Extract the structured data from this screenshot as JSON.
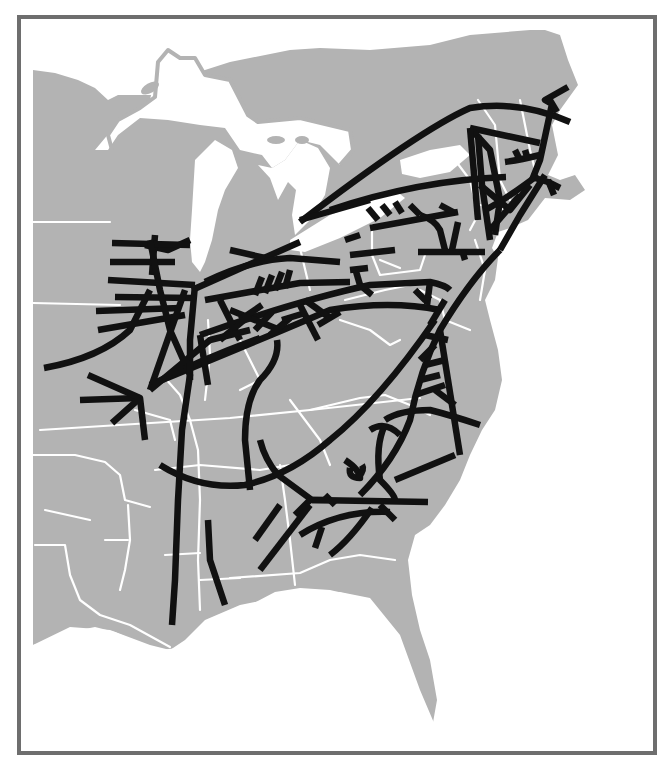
{
  "map": {
    "type": "historical railroad network map",
    "region": "Eastern United States",
    "colors": {
      "background": "#ffffff",
      "frame": "#6e6e6e",
      "land": "#b3b3b3",
      "water": "#ffffff",
      "state_borders": "#ffffff",
      "railroads": "#111111"
    },
    "frame": {
      "x": 17,
      "y": 15,
      "width": 640,
      "height": 740,
      "stroke_width": 4
    },
    "visible_text": [],
    "features": {
      "land_areas": [
        "Midwest",
        "Great Lakes states",
        "New England",
        "Mid-Atlantic",
        "South",
        "Gulf Coast",
        "Florida peninsula"
      ],
      "water_bodies": [
        "Lake Superior",
        "Lake Michigan",
        "Lake Huron",
        "Lake Erie",
        "Lake Ontario",
        "Atlantic Ocean",
        "Gulf of Mexico"
      ],
      "railroad_density": {
        "northeast": "dense web",
        "midwest": "dense grid south of Lake Michigan",
        "south": "sparse scattered segments"
      }
    }
  }
}
